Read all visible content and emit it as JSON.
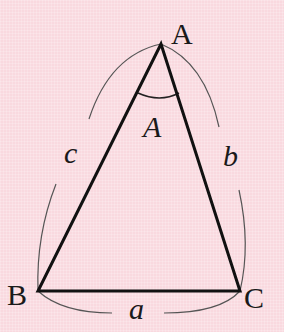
{
  "diagram": {
    "type": "triangle",
    "background_color": "#f9d9df",
    "line_color": "#111111",
    "arc_color": "#555555",
    "vertices": {
      "A": {
        "label": "A",
        "x": 161,
        "y": 44
      },
      "B": {
        "label": "B",
        "x": 38,
        "y": 291
      },
      "C": {
        "label": "C",
        "x": 240,
        "y": 291
      }
    },
    "angle_label": "A",
    "sides": {
      "a": {
        "label": "a",
        "between": "B-C"
      },
      "b": {
        "label": "b",
        "between": "A-C"
      },
      "c": {
        "label": "c",
        "between": "A-B"
      }
    }
  }
}
